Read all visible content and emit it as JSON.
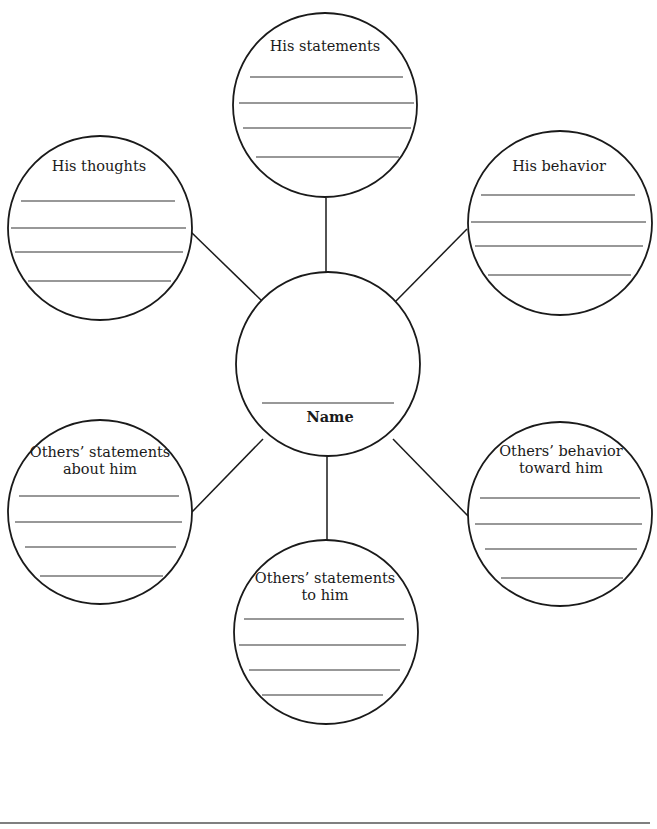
{
  "diagram": {
    "type": "character-web-graphic-organizer",
    "center": {
      "label": "Name",
      "write_line": true
    },
    "nodes": [
      {
        "id": "his-statements",
        "label_lines": [
          "His statements"
        ],
        "write_lines": 4
      },
      {
        "id": "his-thoughts",
        "label_lines": [
          "His thoughts"
        ],
        "write_lines": 4
      },
      {
        "id": "his-behavior",
        "label_lines": [
          "His behavior"
        ],
        "write_lines": 4
      },
      {
        "id": "others-statements-about-him",
        "label_lines": [
          "Others’ statements",
          "about him"
        ],
        "write_lines": 4
      },
      {
        "id": "others-behavior-toward-him",
        "label_lines": [
          "Others’ behavior",
          "toward him"
        ],
        "write_lines": 4
      },
      {
        "id": "others-statements-to-him",
        "label_lines": [
          "Others’ statements",
          "to him"
        ],
        "write_lines": 4
      }
    ],
    "colors": {
      "stroke": "#1a1a1a",
      "background": "#ffffff"
    }
  }
}
